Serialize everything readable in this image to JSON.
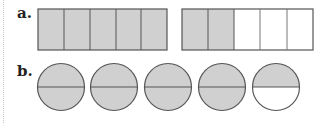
{
  "colors": {
    "shaded": "#d0d0d0",
    "unshaded": "#ffffff",
    "stroke": "#555555"
  },
  "parts": {
    "a": {
      "label": "a.",
      "figures": [
        {
          "type": "rectangle",
          "sections": 5,
          "shaded": 5
        },
        {
          "type": "rectangle",
          "sections": 5,
          "shaded": 2
        }
      ]
    },
    "b": {
      "label": "b.",
      "figures": [
        {
          "type": "circle",
          "halves": 2,
          "shaded": 2
        },
        {
          "type": "circle",
          "halves": 2,
          "shaded": 2
        },
        {
          "type": "circle",
          "halves": 2,
          "shaded": 2
        },
        {
          "type": "circle",
          "halves": 2,
          "shaded": 2
        },
        {
          "type": "circle",
          "halves": 2,
          "shaded": 1
        }
      ]
    }
  }
}
